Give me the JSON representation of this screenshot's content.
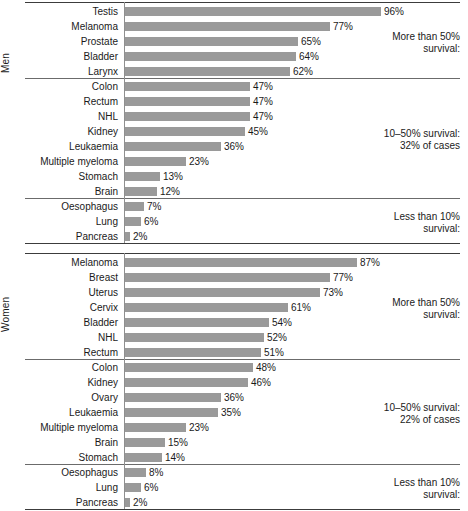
{
  "chart_data": {
    "type": "bar",
    "orientation": "horizontal",
    "title": "",
    "xlabel": "",
    "ylabel": "",
    "xlim": [
      0,
      100
    ],
    "grid": false,
    "value_suffix": "%",
    "panels": [
      {
        "name": "Men",
        "label": "Men",
        "bands": [
          {
            "note_line1": "More than 50%",
            "note_line2": "survival:",
            "categories": [
              "Testis",
              "Melanoma",
              "Prostate",
              "Bladder",
              "Larynx"
            ],
            "values": [
              96,
              77,
              65,
              64,
              62
            ],
            "labels": [
              "96%",
              "77%",
              "65%",
              "64%",
              "62%"
            ]
          },
          {
            "note_line1": "10–50% survival:",
            "note_line2": "32% of cases",
            "categories": [
              "Colon",
              "Rectum",
              "NHL",
              "Kidney",
              "Leukaemia",
              "Multiple myeloma",
              "Stomach",
              "Brain"
            ],
            "values": [
              47,
              47,
              47,
              45,
              36,
              23,
              13,
              12
            ],
            "labels": [
              "47%",
              "47%",
              "47%",
              "45%",
              "36%",
              "23%",
              "13%",
              "12%"
            ]
          },
          {
            "note_line1": "Less than 10%",
            "note_line2": "survival:",
            "categories": [
              "Oesophagus",
              "Lung",
              "Pancreas"
            ],
            "values": [
              7,
              6,
              2
            ],
            "labels": [
              "7%",
              "6%",
              "2%"
            ]
          }
        ]
      },
      {
        "name": "Women",
        "label": "Women",
        "bands": [
          {
            "note_line1": "More than 50%",
            "note_line2": "survival:",
            "categories": [
              "Melanoma",
              "Breast",
              "Uterus",
              "Cervix",
              "Bladder",
              "NHL",
              "Rectum"
            ],
            "values": [
              87,
              77,
              73,
              61,
              54,
              52,
              51
            ],
            "labels": [
              "87%",
              "77%",
              "73%",
              "61%",
              "54%",
              "52%",
              "51%"
            ]
          },
          {
            "note_line1": "10–50% survival:",
            "note_line2": "22% of cases",
            "categories": [
              "Colon",
              "Kidney",
              "Ovary",
              "Leukaemia",
              "Multiple myeloma",
              "Brain",
              "Stomach"
            ],
            "values": [
              48,
              46,
              36,
              35,
              23,
              15,
              14
            ],
            "labels": [
              "48%",
              "46%",
              "36%",
              "35%",
              "23%",
              "15%",
              "14%"
            ]
          },
          {
            "note_line1": "Less than 10%",
            "note_line2": "survival:",
            "categories": [
              "Oesophagus",
              "Lung",
              "Pancreas"
            ],
            "values": [
              8,
              6,
              2
            ],
            "labels": [
              "8%",
              "6%",
              "2%"
            ]
          }
        ]
      }
    ],
    "colors": {
      "bar": "#9a9a9a",
      "rule": "#3c3c3c",
      "text": "#1a1a1a",
      "background": "#ffffff"
    }
  }
}
